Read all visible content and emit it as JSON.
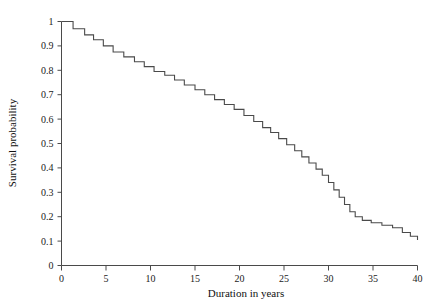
{
  "chart_data": {
    "type": "line",
    "subtype": "step",
    "title": "",
    "xlabel": "Duration in years",
    "ylabel": "Survival probability",
    "xlim": [
      0,
      40
    ],
    "ylim": [
      0,
      1
    ],
    "grid": false,
    "legend": null,
    "line_color": "#4a4a4a",
    "axis_color": "#4a4a4a",
    "background_color": "#ffffff",
    "xticks": [
      0,
      5,
      10,
      15,
      20,
      25,
      30,
      35,
      40
    ],
    "xtick_labels": [
      "0",
      "5",
      "10",
      "15",
      "20",
      "25",
      "30",
      "35",
      "40"
    ],
    "yticks": [
      0,
      0.1,
      0.2,
      0.3,
      0.4,
      0.5,
      0.6,
      0.7,
      0.8,
      0.9,
      1
    ],
    "ytick_labels": [
      "0",
      "0.1",
      "0.2",
      "0.3",
      "0.4",
      "0.5",
      "0.6",
      "0.7",
      "0.8",
      "0.9",
      "1"
    ],
    "x": [
      0.0,
      1.3,
      2.6,
      3.6,
      4.7,
      5.8,
      7.0,
      8.2,
      9.3,
      10.4,
      11.6,
      12.7,
      13.8,
      15.0,
      16.1,
      17.2,
      18.3,
      19.4,
      20.5,
      21.6,
      22.6,
      23.5,
      24.4,
      25.3,
      26.2,
      27.0,
      27.8,
      28.6,
      29.3,
      30.0,
      30.6,
      31.2,
      31.8,
      32.4,
      33.0,
      33.8,
      34.8,
      36.0,
      37.2,
      38.3,
      39.2,
      40.0
    ],
    "y": [
      1.0,
      0.97,
      0.945,
      0.925,
      0.9,
      0.875,
      0.855,
      0.835,
      0.815,
      0.795,
      0.78,
      0.76,
      0.74,
      0.72,
      0.7,
      0.68,
      0.66,
      0.64,
      0.615,
      0.59,
      0.565,
      0.545,
      0.52,
      0.495,
      0.47,
      0.445,
      0.42,
      0.395,
      0.37,
      0.34,
      0.31,
      0.28,
      0.25,
      0.22,
      0.2,
      0.185,
      0.175,
      0.165,
      0.155,
      0.135,
      0.12,
      0.105
    ],
    "series_name": "Survival probability"
  }
}
